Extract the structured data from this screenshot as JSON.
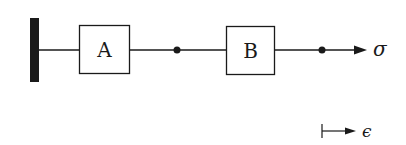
{
  "diagram": {
    "wall_label": "",
    "elements": [
      {
        "id": "box-a",
        "label": "A"
      },
      {
        "id": "box-b",
        "label": "B"
      }
    ],
    "output_label": "σ",
    "strain_label": "ϵ",
    "colors": {
      "stroke": "#1a1a1a",
      "background": "#ffffff"
    }
  }
}
